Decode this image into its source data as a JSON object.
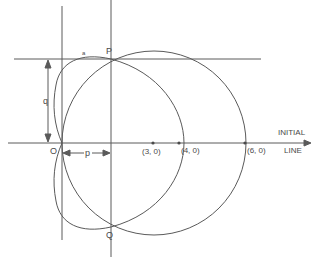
{
  "diagram": {
    "type": "polar-curves",
    "colors": {
      "line": "#5a5a5a",
      "text": "#4a4a4a",
      "background": "#ffffff"
    },
    "points": {
      "pole": {
        "label": "O"
      },
      "p": {
        "label": "P"
      },
      "q": {
        "label": "Q"
      },
      "c3": {
        "label": "(3, 0)"
      },
      "c4": {
        "label": "(4, 0)"
      },
      "c6": {
        "label": "(6, 0)"
      }
    },
    "initial_line": {
      "label_line1": "INITIAL",
      "label_line2": "LINE"
    },
    "dimensions": {
      "q_label": "q",
      "p_label": "p"
    },
    "curves": [
      {
        "name": "circle",
        "equation": "r = 6cosθ",
        "center": "(3, 0)",
        "radius": 3
      },
      {
        "name": "cardioid",
        "equation": "r = 2(1 + cosθ)"
      }
    ],
    "small_mark": "a"
  }
}
